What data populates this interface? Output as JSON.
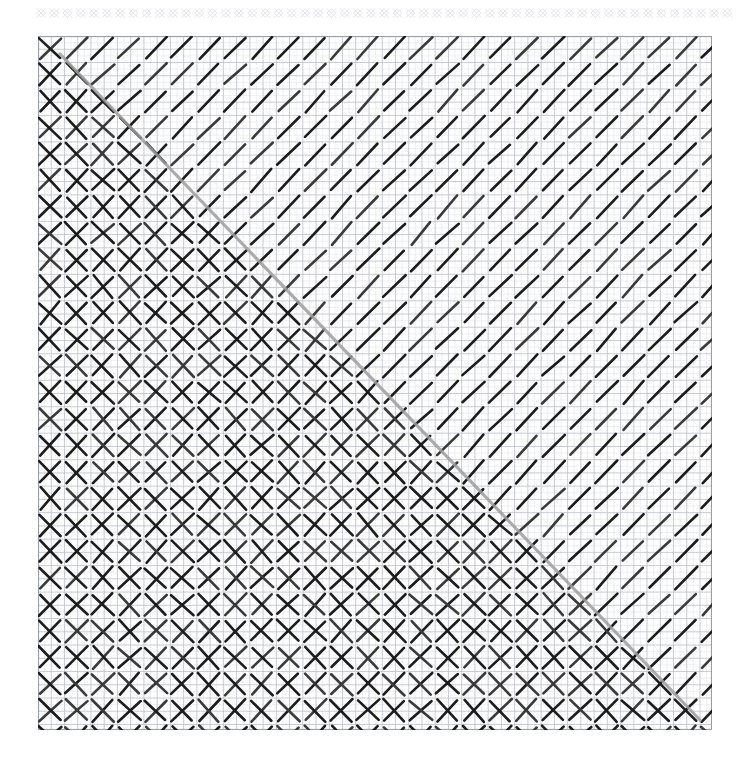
{
  "page": {
    "background_color": "#ffffff",
    "width": 745,
    "height": 769
  },
  "top_strip": {
    "name": "decorative-diamond-border",
    "description": "thin row of small light-gray diamond / X crosshatch motifs",
    "color": "#e3e6ea",
    "x": 36,
    "y": 4,
    "width": 700,
    "height": 18,
    "motif_count": 53,
    "motif_pitch": 13.2,
    "stroke_width": 1.0
  },
  "grid_panel": {
    "name": "graph-paper-panel",
    "x": 38,
    "y": 36,
    "width": 674,
    "height": 694,
    "minor_cell": 6.62,
    "major_cell": 13.24,
    "minor_color": "#e6e8ec",
    "major_color": "#bcc0c7",
    "border_color": "#9a9ea6",
    "background": "#fefefe",
    "minor_cols": 102,
    "minor_rows": 105
  },
  "hatching": {
    "name": "pen-hatching-drawing",
    "lattice_pitch": 26.5,
    "stroke_color_dark": "#1c1c1c",
    "stroke_color_mid": "#3a3a3a",
    "stroke_width": 2.6,
    "up_right_strokes": {
      "label": "ascending diagonal strokes (bottom-left to top-right)",
      "coverage": "entire panel",
      "angle_degrees": 45
    },
    "down_right_strokes": {
      "label": "descending diagonal strokes (top-left to bottom-right)",
      "coverage": "lower-left triangular half only, producing crosshatch diamonds",
      "angle_degrees": -45
    },
    "boundary_line": {
      "label": "gray diagonal division line",
      "color": "#9e9e9e",
      "stroke_width": 3.2,
      "from": [
        22,
        18
      ],
      "to": [
        662,
        684
      ]
    }
  },
  "chart_data": {
    "type": "heatmap",
    "xlabel": "",
    "ylabel": "",
    "grid": true,
    "legend": "none",
    "categories": [
      "upper-right single hatch",
      "diagonal boundary",
      "lower-left crosshatch"
    ],
    "values": [
      1,
      1.5,
      2
    ],
    "series": [
      {
        "name": "ascending strokes per cell",
        "values": [
          1,
          1,
          1
        ]
      },
      {
        "name": "descending strokes per cell",
        "values": [
          0,
          0.5,
          1
        ]
      }
    ],
    "xlim": [
      0,
      674
    ],
    "ylim": [
      0,
      694
    ]
  }
}
